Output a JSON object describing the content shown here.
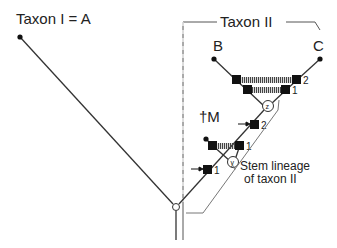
{
  "labels": {
    "taxon1": "Taxon  I = A",
    "taxon2": "Taxon  II",
    "taxonB": "B",
    "taxonC": "C",
    "taxonM": "†M",
    "stem_line1": "Stem lineage",
    "stem_line2": "of taxon II",
    "node_z": "z",
    "node_y": "y",
    "apo_upper_2": "2",
    "apo_upper_1": "1",
    "apo_lower_2": "2",
    "apo_lower_1": "1",
    "apo_stem_1": "1"
  },
  "colors": {
    "line": "#333333",
    "box": "#111111",
    "hatch": "#555555",
    "bracket": "#666666"
  }
}
